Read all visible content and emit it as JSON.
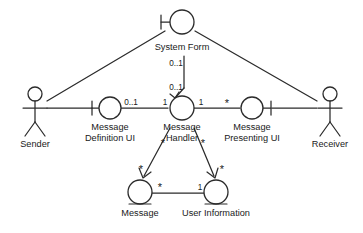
{
  "diagram": {
    "colors": {
      "stroke": "#2b2b2b",
      "text": "#1a1a1a",
      "background": "#ffffff"
    },
    "actors": [
      {
        "id": "sender",
        "label": "Sender"
      },
      {
        "id": "receiver",
        "label": "Receiver"
      }
    ],
    "boundaries": [
      {
        "id": "system-form",
        "label": "System Form"
      },
      {
        "id": "message-definition-ui",
        "label_line1": "Message",
        "label_line2": "Definition UI"
      },
      {
        "id": "message-presenting-ui",
        "label_line1": "Message",
        "label_line2": "Presenting UI"
      }
    ],
    "controls": [
      {
        "id": "message-handler",
        "label_line1": "Message",
        "label_line2": "Handler"
      }
    ],
    "entities": [
      {
        "id": "message",
        "label": "Message"
      },
      {
        "id": "user-information",
        "label": "User Information"
      }
    ],
    "multiplicities": {
      "system_form_top": "0..1",
      "system_form_bottom": "0..1",
      "definition_ui_right": "0..1",
      "handler_left": "1",
      "handler_right": "1",
      "presenting_ui_left": "*",
      "handler_to_message": "*",
      "message_top": "*",
      "handler_to_user_info": "*",
      "user_info_top": "*",
      "message_right": "*",
      "user_info_left": "1"
    }
  }
}
